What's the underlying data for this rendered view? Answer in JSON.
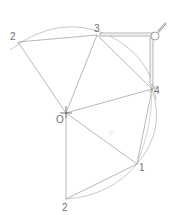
{
  "diagram": {
    "type": "geometric-construction",
    "colors": {
      "line": "#9a9a9a",
      "arc": "#a8a8a8",
      "label": "#707070",
      "compass": "#8a8a8a",
      "background": "#ffffff"
    },
    "center": {
      "name": "O",
      "label": "O",
      "x": 66,
      "y": 113
    },
    "points": [
      {
        "id": "p2top",
        "label": "2",
        "x": 18,
        "y": 42
      },
      {
        "id": "p3",
        "label": "3",
        "x": 97,
        "y": 35
      },
      {
        "id": "p4",
        "label": "4",
        "x": 152,
        "y": 89
      },
      {
        "id": "p1",
        "label": "1",
        "x": 137,
        "y": 164
      },
      {
        "id": "p2bottom",
        "label": "2",
        "x": 66,
        "y": 199
      }
    ],
    "labels": {
      "center": "O",
      "p2top": "2",
      "p3": "3",
      "p4": "4",
      "p1": "1",
      "p2bottom": "2"
    },
    "watermark": "≋",
    "tool": {
      "name": "compass",
      "pivot_x": 157,
      "pivot_y": 35
    }
  }
}
